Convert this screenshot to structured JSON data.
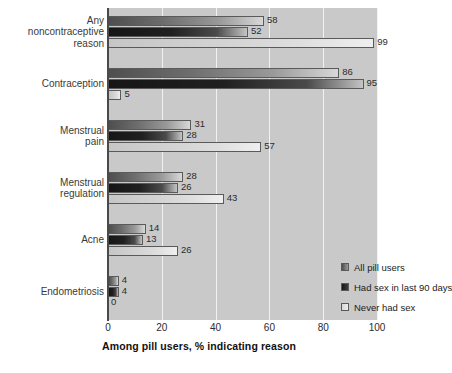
{
  "chart_data": {
    "type": "bar",
    "orientation": "horizontal",
    "title": "",
    "subtitle": "",
    "xlabel": "Among pill users, % indicating reason",
    "ylabel": "",
    "xlim": [
      0,
      100
    ],
    "xticks": [
      0,
      20,
      40,
      60,
      80,
      100
    ],
    "xtick_labels": [
      "0",
      "20",
      "40",
      "60",
      "80",
      "100"
    ],
    "grid": "vertical",
    "legend_position": "inside-bottom-right",
    "categories": [
      "Any\nnoncontraceptive\nreason",
      "Contraception",
      "Menstrual\npain",
      "Menstrual\nregulation",
      "Acne",
      "Endometriosis"
    ],
    "series": [
      {
        "name": "All pill users",
        "color": "#6d6d6d",
        "values": [
          58,
          86,
          31,
          28,
          14,
          4
        ]
      },
      {
        "name": "Had sex in last 90 days",
        "color": "#202020",
        "values": [
          52,
          95,
          28,
          26,
          13,
          4
        ]
      },
      {
        "name": "Never had sex",
        "color": "#dedede",
        "values": [
          99,
          5,
          57,
          43,
          26,
          0
        ]
      }
    ]
  },
  "axis": {
    "title": "Among pill users, % indicating reason"
  },
  "legend": {
    "items": [
      {
        "label": "All pill users"
      },
      {
        "label": "Had sex in last 90 days"
      },
      {
        "label": "Never had sex"
      }
    ]
  },
  "colors": {
    "plot_background": "#c9c9c9",
    "gridline": "#f2f2f2",
    "axis": "#4a4a4a",
    "text": "#2b2b2b",
    "page_background": "#ffffff"
  }
}
